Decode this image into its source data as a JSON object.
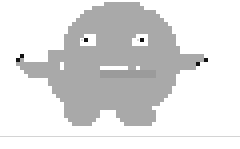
{
  "canvas": {
    "width": 240,
    "height": 149,
    "background_color": "#ffffff",
    "pixel_scale": 4,
    "grid_width": 60,
    "grid_height": 34,
    "title": "Pixel Monster Sprite"
  },
  "palette": {
    "background": "#ffffff",
    "body": "#a9a9a9",
    "body_shade": "#9b9b9b",
    "eye_white": "#ffffff",
    "eye_black": "#111111",
    "eye_glint": "#d8d8d8",
    "tooth": "#ffffff",
    "accent_black": "#111111",
    "divider": "#d4d4d4"
  },
  "divider": {
    "name": "horizontal-rule",
    "y": 136,
    "color": "#d4d4d4",
    "thickness": 1
  },
  "sprite": {
    "name": "monster-character",
    "label": "Gray pixel monster",
    "origin_x": 8,
    "origin_y": 2,
    "rows": [
      "........................111111111.....................",
      ".....................1111111111111....................",
      "...................111111111111111111................",
      "..................11111111111111111111...............",
      ".................1111111111111111111111..............",
      "................111111111111111111111111.............",
      "...............11111111111111111111111111............",
      "...............11111111111111111111111111............",
      "..............1111122211111111112221111111...........",
      "..............1111232211111111122321111111...........",
      "..............1111222211111111122221111111...........",
      "..............11111111111111111111111111111..........",
      "..........111111111111111111111111111111111..........",
      "...b......111111111111111111111111111111111111111....",
      "..b1......111111111111111111111111111111111111111b...",
      "..111111111112111111111111111111111111111111111b.....",
      "...11111111112111111111444444411211111111111111......",
      "....111111111111111111144444441121111111111..........",
      ".....1111111111111111114444444111111111111...........",
      "..........11111111111111111111111111111111...........",
      "..........11111111111111111111111111111111...........",
      "...........111111111111111111111111111111............",
      "...........111111111111111111111111111111............",
      "............1111111111111111111111111111.............",
      ".............11111111111111111111111111..............",
      "..............111111111111111111111111...............",
      "..............1111111111111111111111.................",
      "..............111111111....1111111111................",
      "..............111111111....1111111111................",
      "...............1111111......111111111................",
      "................11111........1111111................."
    ],
    "legend": {
      ".": "transparent",
      "1": "body",
      "2": "eye_white",
      "3": "eye_black",
      "4": "tooth",
      "b": "accent_black"
    },
    "parts": [
      {
        "name": "head",
        "description": "rounded dome top of body"
      },
      {
        "name": "left-eye",
        "description": "white square with black pupil"
      },
      {
        "name": "right-eye",
        "description": "white square with black pupil"
      },
      {
        "name": "mouth",
        "description": "dark gray band with white fangs at each end"
      },
      {
        "name": "left-arm",
        "description": "arm extending left with black pixel tip"
      },
      {
        "name": "right-arm",
        "description": "arm extending right and down with black pixel tip"
      },
      {
        "name": "left-leg",
        "description": "lower left stub foot"
      },
      {
        "name": "right-leg",
        "description": "lower right stub foot"
      }
    ]
  }
}
